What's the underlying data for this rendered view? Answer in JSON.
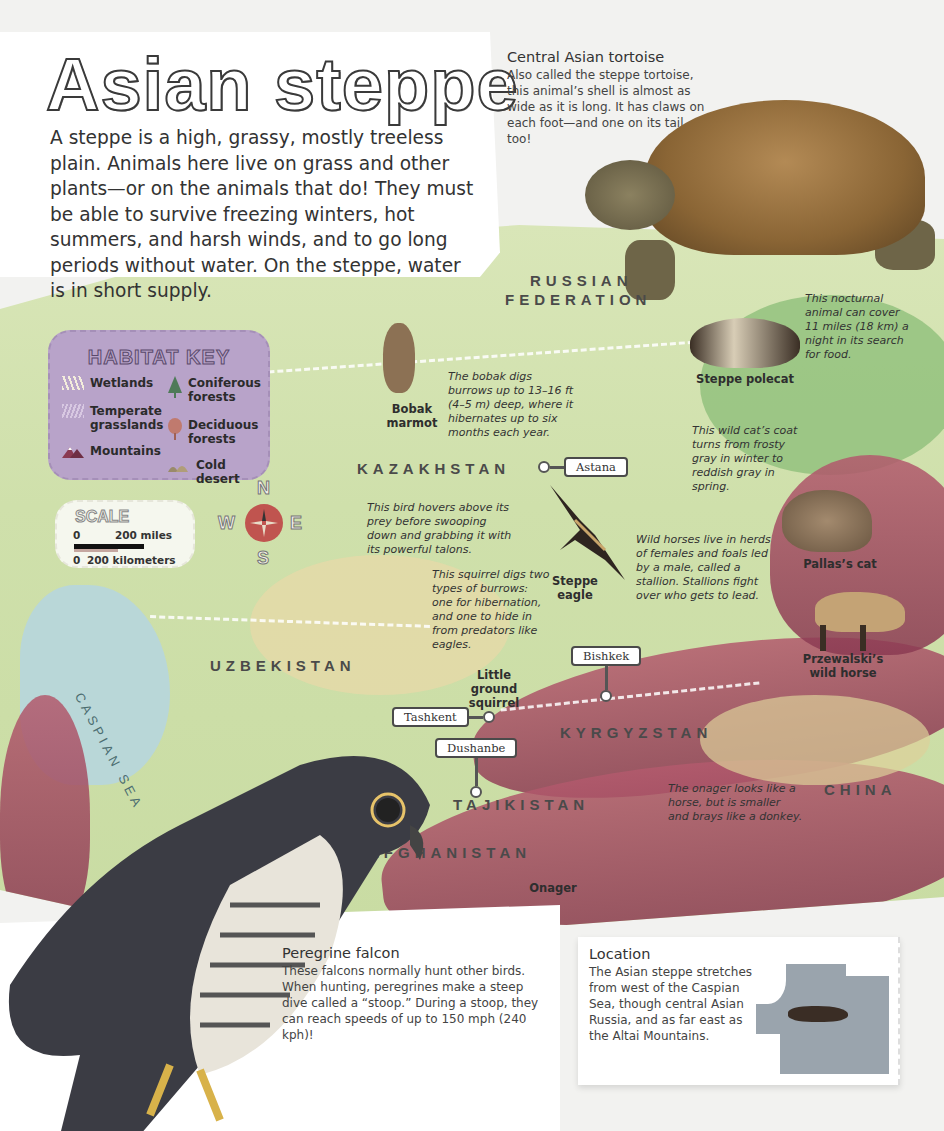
{
  "title": "Asian steppe",
  "intro": "A steppe is a high, grassy, mostly treeless plain. Animals here live on grass and other plants—or on the animals that do! They must be able to survive freezing winters, hot summers, and harsh winds, and to go long periods without water. On the steppe, water is in short supply.",
  "tortoise": {
    "heading": "Central Asian tortoise",
    "text": "Also called the steppe tortoise, this animal’s shell is almost as wide as it is long. It has claws on each foot—and one on its tail, too!"
  },
  "map": {
    "countries": {
      "russia_line1": "RUSSIAN",
      "russia_line2": "FEDERATION",
      "kazakhstan": "KAZAKHSTAN",
      "uzbekistan": "UZBEKISTAN",
      "kyrgyzstan": "KYRGYZSTAN",
      "tajikistan": "TAJIKISTAN",
      "afghanistan": "AFGHANISTAN",
      "china": "CHINA"
    },
    "sea": "CASPIAN SEA",
    "cities": {
      "astana": "Astana",
      "bishkek": "Bishkek",
      "tashkent": "Tashkent",
      "dushanbe": "Dushanbe"
    },
    "colors": {
      "grassland": "#cfe0ab",
      "mountains": "#9a4560",
      "sea": "#b9d7d8",
      "key_bg": "#b8a3c9",
      "compass": "#c0544f"
    }
  },
  "habitat_key": {
    "title": "HABITAT KEY",
    "items": [
      {
        "label": "Wetlands",
        "icon": "wetlands-icon"
      },
      {
        "label": "Coniferous forests",
        "icon": "conifer-tree-icon"
      },
      {
        "label": "Temperate grasslands",
        "icon": "grassland-icon"
      },
      {
        "label": "Deciduous forests",
        "icon": "deciduous-tree-icon"
      },
      {
        "label": "Mountains",
        "icon": "mountain-icon"
      },
      {
        "label": "Cold desert",
        "icon": "desert-icon"
      }
    ],
    "labels": {
      "wetlands": "Wetlands",
      "coniferous_1": "Coniferous",
      "coniferous_2": "forests",
      "temperate_1": "Temperate",
      "temperate_2": "grasslands",
      "deciduous_1": "Deciduous",
      "deciduous_2": "forests",
      "mountains": "Mountains",
      "cold_desert": "Cold desert"
    }
  },
  "scale": {
    "title": "SCALE",
    "miles_zero": "0",
    "miles_label": "200 miles",
    "km_zero": "0",
    "km_label": "200 kilometers"
  },
  "compass": {
    "n": "N",
    "e": "E",
    "s": "S",
    "w": "W"
  },
  "animals": {
    "bobak": {
      "name_1": "Bobak",
      "name_2": "marmot",
      "caption": "The bobak digs burrows up to 13–16 ft (4–5 m) deep, where it hibernates up to six months each year."
    },
    "polecat": {
      "name": "Steppe polecat",
      "caption": "This nocturnal animal can cover 11 miles (18 km) a night in its search for food."
    },
    "pallas_cat": {
      "name": "Pallas’s cat",
      "caption": "This wild cat’s coat turns from frosty gray in winter to reddish gray in spring."
    },
    "eagle": {
      "name_1": "Steppe",
      "name_2": "eagle",
      "caption": "This bird hovers above its prey before swooping down and grabbing it with its powerful talons."
    },
    "squirrel": {
      "name_1": "Little",
      "name_2": "ground",
      "name_3": "squirrel",
      "caption": "This squirrel digs two types of burrows: one for hibernation, and one to hide in from predators like eagles."
    },
    "horse": {
      "name_1": "Przewalski’s",
      "name_2": "wild horse",
      "caption": "Wild horses live in herds of females and foals led by a male, called a stallion. Stallions fight over who gets to lead."
    },
    "onager": {
      "name": "Onager",
      "caption": "The onager looks like a horse, but is smaller and brays like a donkey."
    }
  },
  "falcon": {
    "heading": "Peregrine falcon",
    "text": "These falcons normally hunt other birds. When hunting, peregrines make a steep dive called a “stoop.” During a stoop, they can reach speeds of up to 150 mph (240 kph)!"
  },
  "location": {
    "heading": "Location",
    "text": "The Asian steppe stretches from west of the Caspian Sea, though central Asian Russia, and as far east as the Altai Mountains."
  }
}
